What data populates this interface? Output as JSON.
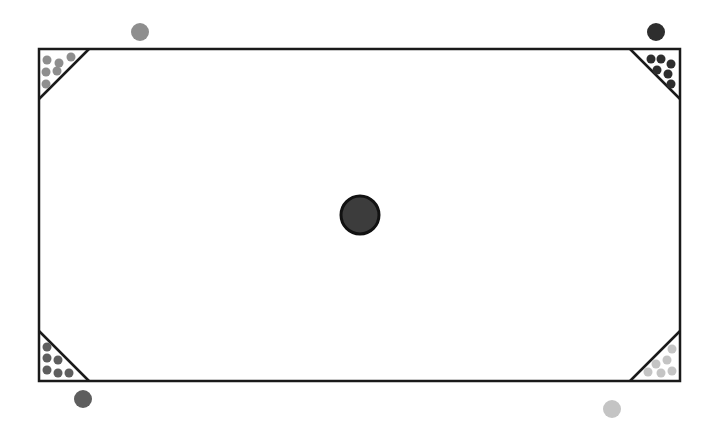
{
  "game": {
    "board": {
      "x": 39,
      "y": 49,
      "width": 641,
      "height": 332,
      "stroke": "#1a1a1a",
      "fill": "#ffffff",
      "corner_leg": 50
    },
    "center_piece": {
      "cx": 360,
      "cy": 215,
      "r": 19,
      "fill": "#3c3c3c",
      "stroke": "#111111"
    },
    "players": [
      {
        "name": "top-left",
        "color": "#8e8e8e",
        "marker": {
          "cx": 140,
          "cy": 32,
          "r": 9
        },
        "pieces": [
          [
            47,
            60
          ],
          [
            59,
            63
          ],
          [
            71,
            57
          ],
          [
            46,
            72
          ],
          [
            57,
            71
          ],
          [
            46,
            84
          ]
        ]
      },
      {
        "name": "top-right",
        "color": "#2e2e2e",
        "marker": {
          "cx": 656,
          "cy": 32,
          "r": 9
        },
        "pieces": [
          [
            651,
            59
          ],
          [
            661,
            59
          ],
          [
            671,
            64
          ],
          [
            657,
            70
          ],
          [
            668,
            74
          ],
          [
            671,
            84
          ]
        ]
      },
      {
        "name": "bottom-left",
        "color": "#5e5e5e",
        "marker": {
          "cx": 83,
          "cy": 399,
          "r": 9
        },
        "pieces": [
          [
            47,
            347
          ],
          [
            47,
            358
          ],
          [
            58,
            360
          ],
          [
            47,
            370
          ],
          [
            58,
            373
          ],
          [
            69,
            373
          ]
        ]
      },
      {
        "name": "bottom-right",
        "color": "#c4c4c4",
        "marker": {
          "cx": 612,
          "cy": 409,
          "r": 9
        },
        "pieces": [
          [
            672,
            349
          ],
          [
            667,
            360
          ],
          [
            656,
            364
          ],
          [
            648,
            372
          ],
          [
            661,
            373
          ],
          [
            672,
            371
          ]
        ]
      }
    ]
  }
}
